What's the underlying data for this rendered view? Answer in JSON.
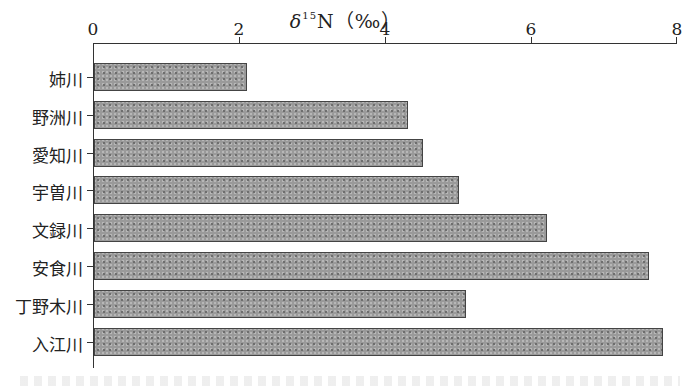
{
  "chart_data": {
    "type": "bar",
    "orientation": "horizontal",
    "xlabel": "δ15N (‰)",
    "ylabel": "",
    "xlim": [
      0,
      8
    ],
    "x_ticks": [
      "0",
      "2",
      "4",
      "6",
      "8"
    ],
    "axis_position": "top",
    "grid": false,
    "legend": null,
    "categories": [
      "姉川",
      "野洲川",
      "愛知川",
      "宇曽川",
      "文録川",
      "安食川",
      "丁野木川",
      "入江川"
    ],
    "values": [
      2.1,
      4.3,
      4.5,
      5.0,
      6.2,
      7.6,
      5.1,
      7.8
    ],
    "bar_fill": "#9a9a9a",
    "bar_pattern": "dotted",
    "bar_edge": "#444444"
  },
  "title": {
    "delta": "δ",
    "sup": "15",
    "rest": "N（‰）"
  },
  "ticks": [
    "0",
    "2",
    "4",
    "6",
    "8"
  ],
  "rivers": [
    "姉川",
    "野洲川",
    "愛知川",
    "宇曽川",
    "文録川",
    "安食川",
    "丁野木川",
    "入江川"
  ]
}
